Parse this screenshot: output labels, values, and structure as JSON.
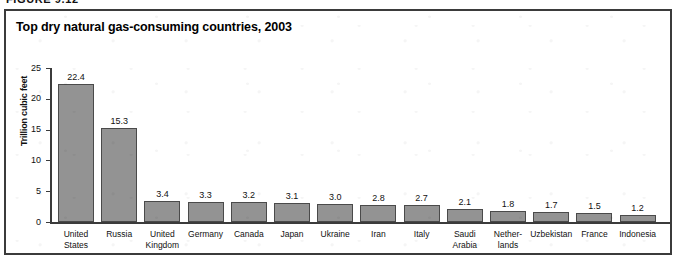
{
  "figure": {
    "label": "FIGURE 9.12"
  },
  "chart_data": {
    "type": "bar",
    "title": "Top dry natural gas-consuming countries, 2003",
    "xlabel": "",
    "ylabel": "Trillion cubic feet",
    "ylim": [
      0,
      25
    ],
    "yticks": [
      0,
      5,
      10,
      15,
      20,
      25
    ],
    "ytick_labels": [
      "0",
      "5",
      "10",
      "15",
      "20",
      "25"
    ],
    "grid": false,
    "legend": null,
    "categories": [
      "United States",
      "Russia",
      "United Kingdom",
      "Germany",
      "Canada",
      "Japan",
      "Ukraine",
      "Iran",
      "Italy",
      "Saudi Arabia",
      "Netherlands",
      "Uzbekistan",
      "France",
      "Indonesia"
    ],
    "category_lines": [
      [
        "United",
        "States"
      ],
      [
        "Russia"
      ],
      [
        "United",
        "Kingdom"
      ],
      [
        "Germany"
      ],
      [
        "Canada"
      ],
      [
        "Japan"
      ],
      [
        "Ukraine"
      ],
      [
        "Iran"
      ],
      [
        "Italy"
      ],
      [
        "Saudi",
        "Arabia"
      ],
      [
        "Nether-",
        "lands"
      ],
      [
        "Uzbekistan"
      ],
      [
        "France"
      ],
      [
        "Indonesia"
      ]
    ],
    "values": [
      22.4,
      15.3,
      3.4,
      3.3,
      3.2,
      3.1,
      3.0,
      2.8,
      2.7,
      2.1,
      1.8,
      1.7,
      1.5,
      1.2
    ],
    "value_labels": [
      "22.4",
      "15.3",
      "3.4",
      "3.3",
      "3.2",
      "3.1",
      "3.0",
      "2.8",
      "2.7",
      "2.1",
      "1.8",
      "1.7",
      "1.5",
      "1.2"
    ],
    "bar_color": "#939393",
    "bar_border_color": "#4a4a4a",
    "axis_color": "#3b3b3b",
    "background_color": "#ffffff"
  }
}
